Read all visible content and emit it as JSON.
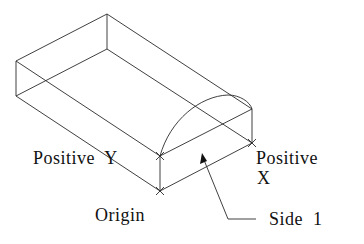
{
  "diagram": {
    "type": "isometric-box",
    "labels": {
      "positive_y": "Positive  Y",
      "positive_x_line1": "Positive",
      "positive_x_line2": "X",
      "origin": "Origin",
      "side": "Side  1"
    },
    "colors": {
      "line": "#2a2a2a",
      "text": "#111111",
      "background": "#ffffff"
    }
  }
}
